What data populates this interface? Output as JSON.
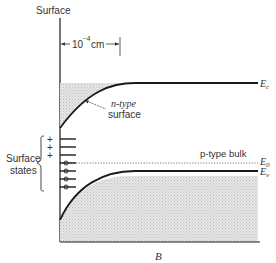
{
  "figure": {
    "axis_label": "Surface",
    "dimension_label_base": "10",
    "dimension_label_exp": "−4",
    "dimension_label_unit": "cm",
    "surface_annotation_line1": "n-type",
    "surface_annotation_line2": "surface",
    "bulk_annotation": "p-type bulk",
    "surface_states_line1": "Surface",
    "surface_states_line2": "states",
    "plus_sign": "+",
    "caption": "B",
    "levels": {
      "conduction_band": {
        "label": "E",
        "subscript": "c"
      },
      "fermi_level": {
        "label": "E",
        "subscript": "0"
      },
      "valence_band": {
        "label": "E",
        "subscript": "v"
      }
    },
    "surface_state_counts": {
      "empty_donor_plus": 3,
      "filled_acceptor_circles": 4
    },
    "colors": {
      "line": "#1a1a1a",
      "shade": "#d9d9d9",
      "text": "#333333"
    }
  }
}
